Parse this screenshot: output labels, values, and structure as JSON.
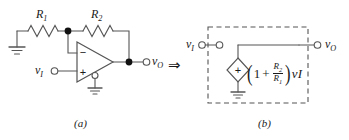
{
  "figure": {
    "type": "circuit-schematic",
    "line_color": "#555555",
    "text_color": "#1a1a1a",
    "node_dot_color": "#111111",
    "dashed_box_color": "#555555",
    "background": "#ffffff"
  },
  "transform_symbol": "⇒",
  "panel_a": {
    "caption": "(a)",
    "resistors": [
      {
        "name": "R1",
        "label_base": "R",
        "label_sub": "1"
      },
      {
        "name": "R2",
        "label_base": "R",
        "label_sub": "2"
      }
    ],
    "terminals": [
      {
        "name": "input",
        "label_base": "v",
        "label_sub": "I"
      },
      {
        "name": "output",
        "label_base": "v",
        "label_sub": "O"
      }
    ],
    "opamp": {
      "inverting_input_sign": "−",
      "noninverting_input_sign": "+"
    },
    "grounds": 2,
    "junction_nodes": 2
  },
  "panel_b": {
    "caption": "(b)",
    "terminals": [
      {
        "name": "input",
        "label_base": "v",
        "label_sub": "I"
      },
      {
        "name": "output",
        "label_base": "v",
        "label_sub": "O"
      }
    ],
    "dependent_source": {
      "shape": "diamond",
      "polarity_sign": "+",
      "expression": "(1 + R2/R1) vI",
      "expr_open_paren": "(",
      "expr_one": "1",
      "expr_plus": "+",
      "expr_num_base": "R",
      "expr_num_sub": "2",
      "expr_den_base": "R",
      "expr_den_sub": "1",
      "expr_close_paren": ")",
      "expr_var_base": "v",
      "expr_var_sub": "I"
    },
    "grounds": 1,
    "enclosure": "dashed-rectangle"
  }
}
